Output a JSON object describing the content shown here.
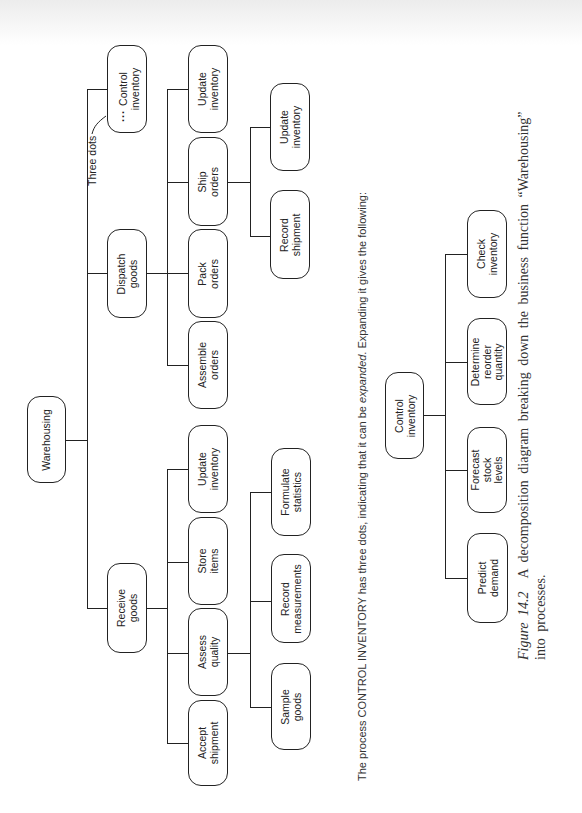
{
  "diagram": {
    "root": "Warehousing",
    "level1": [
      {
        "id": "receive",
        "label": "Receive\ngoods"
      },
      {
        "id": "dispatch",
        "label": "Dispatch\ngoods"
      },
      {
        "id": "control",
        "label": "Control\ninventory",
        "expand_marker": "..."
      }
    ],
    "receive_children": [
      {
        "label": "Accept\nshipment"
      },
      {
        "label": "Assess\nquality"
      },
      {
        "label": "Store\nitems"
      },
      {
        "label": "Update\ninventory"
      }
    ],
    "assess_children": [
      {
        "label": "Sample\ngoods"
      },
      {
        "label": "Record\nmeasurements"
      },
      {
        "label": "Formulate\nstatistics"
      }
    ],
    "dispatch_children": [
      {
        "label": "Assemble\norders"
      },
      {
        "label": "Pack\norders"
      },
      {
        "label": "Ship\norders"
      },
      {
        "label": "Update\ninventory"
      }
    ],
    "ship_children": [
      {
        "label": "Record\nshipment"
      },
      {
        "label": "Update\ninventory"
      }
    ],
    "annotation": "Three dots"
  },
  "body_text": {
    "before": "The process CONTROL INVENTORY has three dots, indicating that it can be ",
    "emphasis": "expanded",
    "after": ". Expanding it gives the following:"
  },
  "expanded_diagram": {
    "root": "Control\ninventory",
    "children": [
      {
        "label": "Predict\ndemand"
      },
      {
        "label": "Forecast\nstock\nlevels"
      },
      {
        "label": "Determine\nreorder\nquantity"
      },
      {
        "label": "Check\ninventory"
      }
    ]
  },
  "caption": {
    "figure_label": "Figure 14.2",
    "line1": "A decomposition diagram breaking down the business function “Warehousing”",
    "line2": "into processes."
  }
}
